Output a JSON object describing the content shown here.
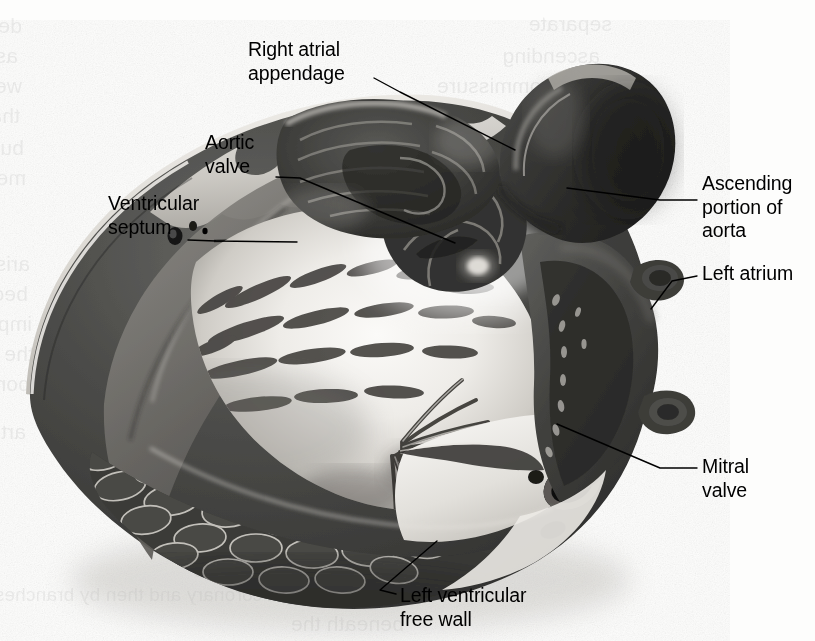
{
  "figure": {
    "kind": "anatomical-illustration",
    "style": "grayscale halftone airbrush rendering",
    "width": 815,
    "height": 641
  },
  "labels": [
    {
      "id": "right-atrial-appendage",
      "lines": [
        "Right atrial",
        "appendage"
      ],
      "text": "Right atrial appendage",
      "x": 248,
      "y": 38,
      "align": "left",
      "leader": [
        [
          374,
          78
        ],
        [
          400,
          92
        ],
        [
          515,
          150
        ]
      ]
    },
    {
      "id": "aortic-valve",
      "lines": [
        "Aortic",
        "valve"
      ],
      "text": "Aortic valve",
      "x": 205,
      "y": 131,
      "align": "left",
      "leader": [
        [
          276,
          177
        ],
        [
          300,
          178
        ],
        [
          455,
          243
        ]
      ]
    },
    {
      "id": "ventricular-septum",
      "lines": [
        "Ventricular",
        "septum"
      ],
      "text": "Ventricular septum",
      "x": 108,
      "y": 192,
      "align": "left",
      "leader": [
        [
          188,
          240
        ],
        [
          216,
          241
        ],
        [
          297,
          242
        ]
      ]
    },
    {
      "id": "ascending-portion-of-aorta",
      "lines": [
        "Ascending",
        "portion of",
        "aorta"
      ],
      "text": "Ascending portion of aorta",
      "x": 702,
      "y": 172,
      "align": "right",
      "leader": [
        [
          697,
          200
        ],
        [
          660,
          200
        ],
        [
          567,
          188
        ]
      ]
    },
    {
      "id": "left-atrium",
      "lines": [
        "Left atrium"
      ],
      "text": "Left atrium",
      "x": 702,
      "y": 262,
      "align": "right",
      "leader": [
        [
          697,
          276
        ],
        [
          672,
          281
        ],
        [
          651,
          309
        ]
      ]
    },
    {
      "id": "mitral-valve",
      "lines": [
        "Mitral",
        "valve"
      ],
      "text": "Mitral valve",
      "x": 702,
      "y": 455,
      "align": "right",
      "leader": [
        [
          697,
          468
        ],
        [
          660,
          468
        ],
        [
          557,
          424
        ]
      ]
    },
    {
      "id": "left-ventricular-free-wall",
      "lines": [
        "Left ventricular",
        "free wall"
      ],
      "text": "Left ventricular free wall",
      "x": 400,
      "y": 584,
      "align": "left",
      "leader": [
        [
          396,
          594
        ],
        [
          380,
          590
        ],
        [
          437,
          541
        ]
      ]
    }
  ],
  "bleed_through_text": [
    {
      "text": "descends across the septal leaflet",
      "x": 22,
      "y": 14,
      "size": 21
    },
    {
      "text": "as the lip of the valve to make up the atrioventricular bundle",
      "x": 18,
      "y": 44,
      "size": 21
    },
    {
      "text": "we call the atrioventricular (nodal) bundle",
      "x": 22,
      "y": 74,
      "size": 21
    },
    {
      "text": "that the communicating fibres of the A-V of the left",
      "x": 20,
      "y": 104,
      "size": 21
    },
    {
      "text": "bundle branch, and not to be",
      "x": 24,
      "y": 136,
      "size": 21
    },
    {
      "text": "mentioned here",
      "x": 26,
      "y": 166,
      "size": 21
    },
    {
      "text": "arise in the",
      "x": 30,
      "y": 252,
      "size": 21
    },
    {
      "text": "because the",
      "x": 28,
      "y": 282,
      "size": 21
    },
    {
      "text": "important",
      "x": 32,
      "y": 312,
      "size": 21
    },
    {
      "text": "the left",
      "x": 34,
      "y": 342,
      "size": 21
    },
    {
      "text": "portion",
      "x": 30,
      "y": 372,
      "size": 21
    },
    {
      "text": "arteries",
      "x": 26,
      "y": 420,
      "size": 21
    },
    {
      "text": "of coronary flow",
      "x": 392,
      "y": 524,
      "size": 21
    },
    {
      "text": "the pulmonary artery",
      "x": 386,
      "y": 554,
      "size": 21
    },
    {
      "text": "of the right coronary and then by branches to aortic valve leaflets",
      "x": 360,
      "y": 584,
      "size": 19
    },
    {
      "text": "beneath the",
      "x": 404,
      "y": 612,
      "size": 21
    },
    {
      "text": "separate",
      "x": 612,
      "y": 12,
      "size": 21
    },
    {
      "text": "ascending",
      "x": 600,
      "y": 44,
      "size": 21
    },
    {
      "text": "the commissure",
      "x": 588,
      "y": 74,
      "size": 21
    }
  ],
  "palette": {
    "paper": "#fdfdfc",
    "ink": "#000000",
    "myocardium_dark": "#3a3a3a",
    "myocardium_mid": "#5a5a5a",
    "endocardium_light": "#e8e6e2",
    "highlight": "#f6f5f2",
    "epicardium_rim": "#cfcdc8",
    "shadow": "#1c1c1c"
  }
}
